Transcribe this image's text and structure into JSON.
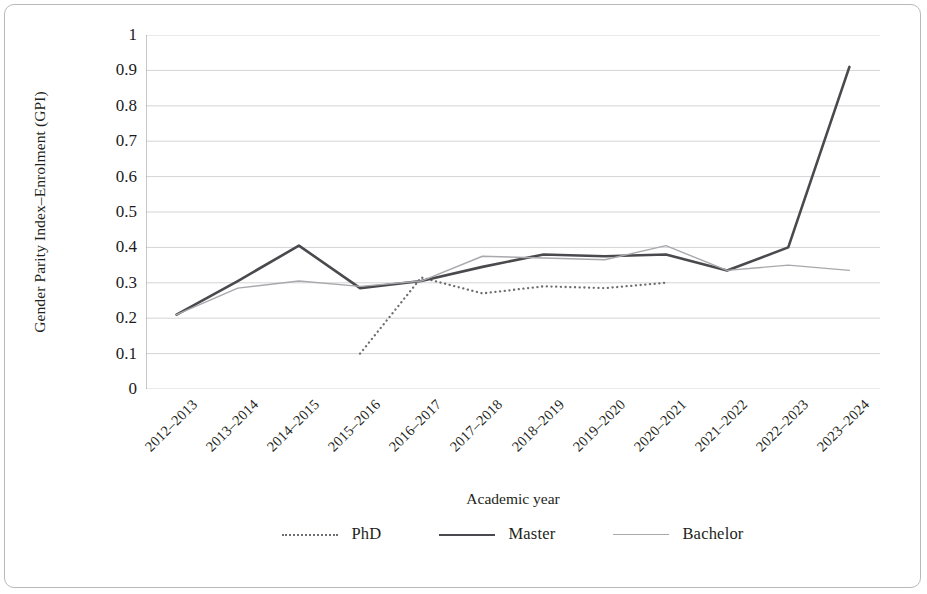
{
  "chart_data": {
    "type": "line",
    "title": "",
    "xlabel": "Academic year",
    "ylabel": "Gender Parity Index–Enrolment (GPI)",
    "ylim": [
      0,
      1
    ],
    "ytick_labels": [
      "1",
      "0.9",
      "0.8",
      "0.7",
      "0.6",
      "0.5",
      "0.4",
      "0.3",
      "0.2",
      "0.1",
      "0"
    ],
    "ytick_values": [
      1,
      0.9,
      0.8,
      0.7,
      0.6,
      0.5,
      0.4,
      0.3,
      0.2,
      0.1,
      0
    ],
    "grid": true,
    "legend_position": "bottom",
    "categories": [
      "2012–2013",
      "2013–2014",
      "2014–2015",
      "2015–2016",
      "2016–2017",
      "2017–2018",
      "2018–2019",
      "2019–2020",
      "2020–2021",
      "2021–2022",
      "2022–2023",
      "2023–2024"
    ],
    "series": [
      {
        "name": "PhD",
        "style": "dotted",
        "color": "#6e6e72",
        "values": [
          null,
          null,
          null,
          0.1,
          0.315,
          0.27,
          0.29,
          0.285,
          0.3,
          null,
          null,
          null
        ]
      },
      {
        "name": "Master",
        "style": "solid-thick",
        "color": "#4a4a4e",
        "values": [
          0.21,
          0.305,
          0.405,
          0.285,
          0.305,
          0.345,
          0.38,
          0.375,
          0.38,
          0.335,
          0.4,
          0.91
        ]
      },
      {
        "name": "Bachelor",
        "style": "solid-thin",
        "color": "#a9a9ad",
        "values": [
          0.21,
          0.285,
          0.305,
          0.29,
          0.305,
          0.375,
          0.37,
          0.365,
          0.405,
          0.335,
          0.35,
          0.335
        ]
      }
    ]
  },
  "legend": {
    "items": [
      {
        "label": "PhD",
        "swatch": "dotted-line-icon"
      },
      {
        "label": "Master",
        "swatch": "solid-thick-line-icon"
      },
      {
        "label": "Bachelor",
        "swatch": "solid-thin-line-icon"
      }
    ]
  },
  "colors": {
    "phd": "#6e6e72",
    "master": "#4a4a4e",
    "bachelor": "#a9a9ad",
    "grid": "#d4d4d6",
    "axis": "#9a9a9d",
    "frame": "#b9b9bb",
    "text": "#231f20"
  }
}
